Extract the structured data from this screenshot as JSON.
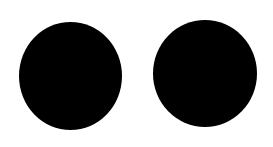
{
  "canvas": {
    "width": 273,
    "height": 147,
    "background": "#ffffff"
  },
  "shapes": [
    {
      "name": "left-circle",
      "color": "#000000",
      "left": 19,
      "top": 22,
      "width": 103,
      "height": 108
    },
    {
      "name": "right-circle",
      "color": "#000000",
      "left": 153,
      "top": 20,
      "width": 104,
      "height": 107
    }
  ]
}
